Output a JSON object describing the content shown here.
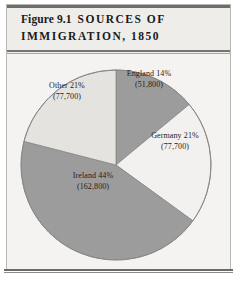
{
  "figure": {
    "number_label": "Figure 9.1",
    "title_caps_line1": "SOURCES OF",
    "title_caps_line2": "IMMIGRATION, 1850"
  },
  "chart_data": {
    "type": "pie",
    "xlabel": "",
    "ylabel": "",
    "legend_position": "none",
    "grid": false,
    "total": 370000,
    "units": "immigrants",
    "categories": [
      "England",
      "Germany",
      "Ireland",
      "Other"
    ],
    "values": [
      51800,
      77700,
      162800,
      77700
    ],
    "percents": [
      14,
      21,
      44,
      21
    ],
    "start_angle_deg": 0,
    "direction": "clockwise",
    "slices": [
      {
        "name": "England",
        "percent": 14,
        "value": 51800,
        "label_name": "England 14%",
        "label_value": "(51,800)",
        "color": "#9c9c9c",
        "start_deg": 0,
        "end_deg": 50.4
      },
      {
        "name": "Germany",
        "percent": 21,
        "value": 77700,
        "label_name": "Germany 21%",
        "label_value": "(77,700)",
        "color": "#f2f1ef",
        "start_deg": 50.4,
        "end_deg": 126.0
      },
      {
        "name": "Ireland",
        "percent": 44,
        "value": 162800,
        "label_name": "Ireland 44%",
        "label_value": "(162,800)",
        "color": "#9c9c9c",
        "start_deg": 126.0,
        "end_deg": 284.4
      },
      {
        "name": "Other",
        "percent": 21,
        "value": 77700,
        "label_name": "Other 21%",
        "label_value": "(77,700)",
        "color": "#e4e3e0",
        "start_deg": 284.4,
        "end_deg": 360.0
      }
    ]
  },
  "colors": {
    "page_background": "#ffffff",
    "panel_background": "#f4f3f1",
    "title_band_background": "#eeedea",
    "rule": "#6f6d6a",
    "text": "#1a1a1a",
    "slice_outline": "#8a8884"
  }
}
